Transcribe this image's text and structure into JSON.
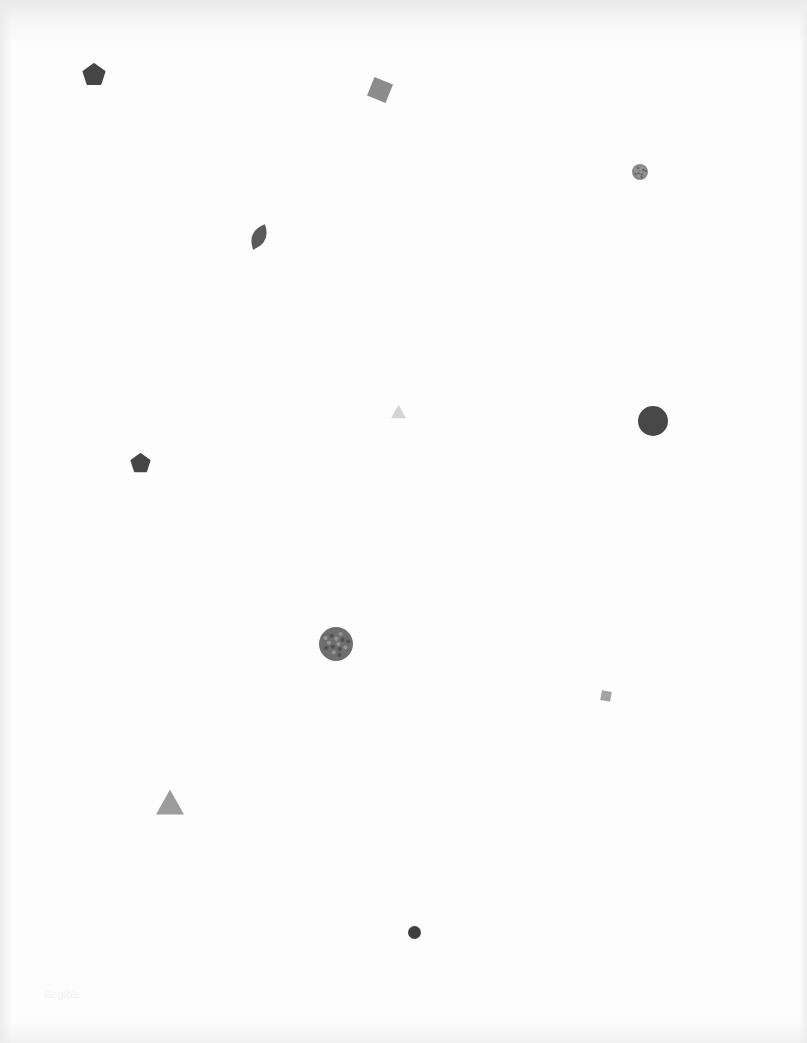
{
  "page": {
    "background": "#fdfdfd"
  },
  "shapes": [
    {
      "id": "pentagon-1",
      "type": "pentagon",
      "cx": 94,
      "cy": 75,
      "size": 22,
      "rotation": 0,
      "color": "#454545"
    },
    {
      "id": "square-1",
      "type": "square",
      "cx": 380,
      "cy": 90,
      "size": 20,
      "rotation": 22,
      "color": "#8c8c8c"
    },
    {
      "id": "circle-textured-1",
      "type": "circle",
      "cx": 640,
      "cy": 172,
      "size": 16,
      "color": "#8a8a8a",
      "textured": true
    },
    {
      "id": "leaf-1",
      "type": "leaf",
      "cx": 259,
      "cy": 237,
      "width": 17,
      "height": 28,
      "rotation": 25,
      "color": "#5a5a5a"
    },
    {
      "id": "triangle-1",
      "type": "triangle",
      "cx": 398,
      "cy": 411,
      "size": 15,
      "color": "#d4d4d4"
    },
    {
      "id": "circle-1",
      "type": "circle",
      "cx": 653,
      "cy": 421,
      "size": 30,
      "color": "#484848"
    },
    {
      "id": "pentagon-2",
      "type": "pentagon",
      "cx": 140,
      "cy": 463,
      "size": 19,
      "rotation": 0,
      "color": "#454545"
    },
    {
      "id": "circle-textured-2",
      "type": "circle",
      "cx": 336,
      "cy": 644,
      "size": 34,
      "color": "#6e6e6e",
      "textured": true
    },
    {
      "id": "square-2",
      "type": "square",
      "cx": 606,
      "cy": 696,
      "size": 10,
      "rotation": 10,
      "color": "#a3a3a3"
    },
    {
      "id": "triangle-2",
      "type": "triangle",
      "cx": 170,
      "cy": 802,
      "size": 28,
      "color": "#9c9c9c"
    },
    {
      "id": "circle-2",
      "type": "circle",
      "cx": 414,
      "cy": 932,
      "size": 13,
      "color": "#3f3f3f"
    }
  ],
  "footer": {
    "faint_text": "illegible"
  }
}
